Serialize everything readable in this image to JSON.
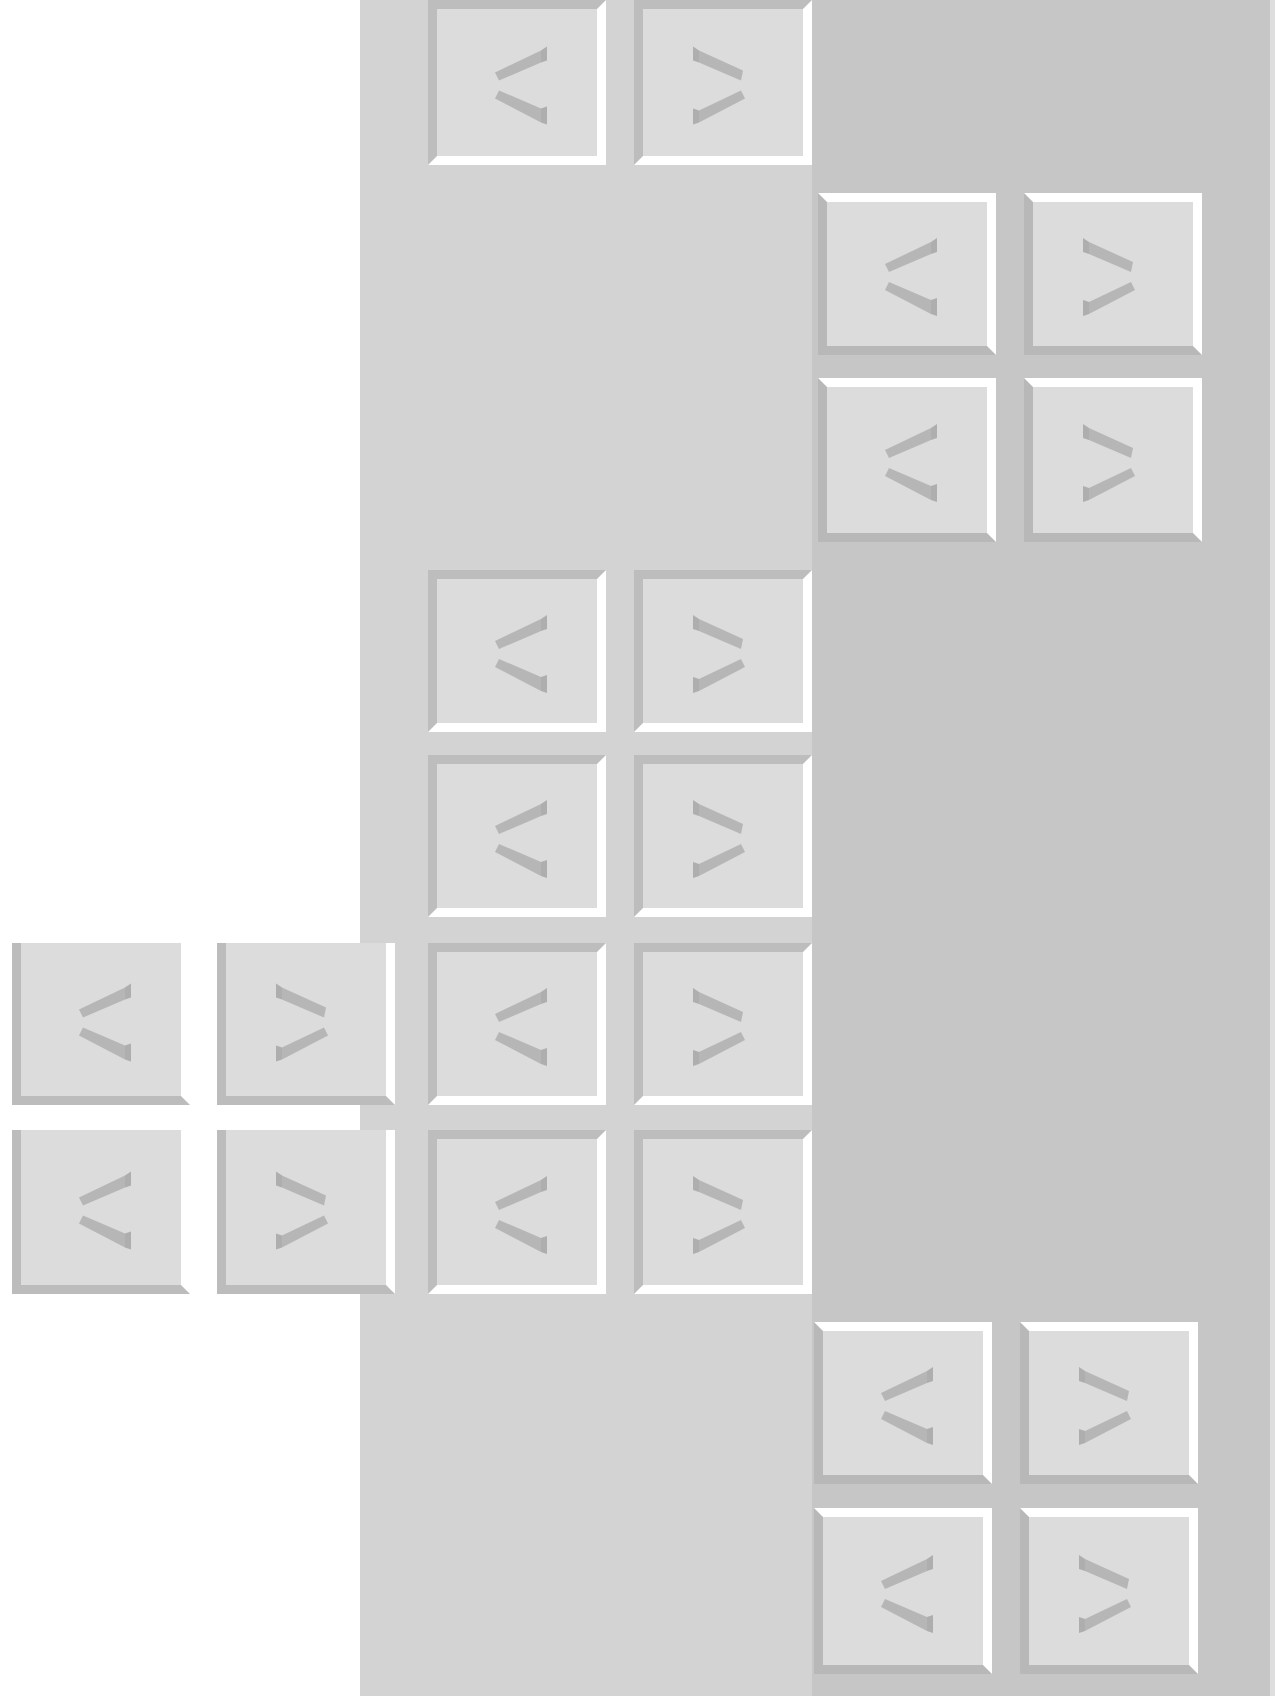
{
  "colors": {
    "page_bg": "#ffffff",
    "middle_region": "#d3d3d3",
    "right_region": "#c6c6c6",
    "button_face": "#dcdcdc",
    "bevel_dark": "#bcbcbc",
    "bevel_light": "#ffffff",
    "chevron": "#aaaaaa"
  },
  "button_groups": [
    {
      "name": "middle-group",
      "style": "inset",
      "buttons": [
        {
          "icon": "chevron-left-icon",
          "glyph": "<",
          "x": 428,
          "y": 0,
          "h": 165
        },
        {
          "icon": "chevron-right-icon",
          "glyph": ">",
          "x": 634,
          "y": 0,
          "h": 165
        },
        {
          "icon": "chevron-left-icon",
          "glyph": "<",
          "x": 428,
          "y": 570,
          "h": 162
        },
        {
          "icon": "chevron-right-icon",
          "glyph": ">",
          "x": 634,
          "y": 570,
          "h": 162
        },
        {
          "icon": "chevron-left-icon",
          "glyph": "<",
          "x": 428,
          "y": 755,
          "h": 162
        },
        {
          "icon": "chevron-right-icon",
          "glyph": ">",
          "x": 634,
          "y": 755,
          "h": 162
        },
        {
          "icon": "chevron-left-icon",
          "glyph": "<",
          "x": 428,
          "y": 943,
          "h": 162
        },
        {
          "icon": "chevron-right-icon",
          "glyph": ">",
          "x": 634,
          "y": 943,
          "h": 162
        },
        {
          "icon": "chevron-left-icon",
          "glyph": "<",
          "x": 428,
          "y": 1130,
          "h": 164
        },
        {
          "icon": "chevron-right-icon",
          "glyph": ">",
          "x": 634,
          "y": 1130,
          "h": 164
        }
      ]
    },
    {
      "name": "right-top-group",
      "style": "raised",
      "buttons": [
        {
          "icon": "chevron-left-icon",
          "glyph": "<",
          "x": 818,
          "y": 193,
          "h": 162
        },
        {
          "icon": "chevron-right-icon",
          "glyph": ">",
          "x": 1024,
          "y": 193,
          "h": 162
        },
        {
          "icon": "chevron-left-icon",
          "glyph": "<",
          "x": 818,
          "y": 378,
          "h": 164
        },
        {
          "icon": "chevron-right-icon",
          "glyph": ">",
          "x": 1024,
          "y": 378,
          "h": 164
        }
      ]
    },
    {
      "name": "right-bottom-group",
      "style": "raised",
      "buttons": [
        {
          "icon": "chevron-left-icon",
          "glyph": "<",
          "x": 814,
          "y": 1322,
          "h": 162
        },
        {
          "icon": "chevron-right-icon",
          "glyph": ">",
          "x": 1020,
          "y": 1322,
          "h": 162
        },
        {
          "icon": "chevron-left-icon",
          "glyph": "<",
          "x": 814,
          "y": 1508,
          "h": 166
        },
        {
          "icon": "chevron-right-icon",
          "glyph": ">",
          "x": 1020,
          "y": 1508,
          "h": 166
        }
      ]
    },
    {
      "name": "left-group",
      "style": "flat",
      "buttons": [
        {
          "icon": "chevron-left-icon",
          "glyph": "<",
          "x": 12,
          "y": 943,
          "h": 162
        },
        {
          "icon": "chevron-right-icon",
          "glyph": ">",
          "x": 217,
          "y": 943,
          "h": 162
        },
        {
          "icon": "chevron-left-icon",
          "glyph": "<",
          "x": 12,
          "y": 1130,
          "h": 164
        },
        {
          "icon": "chevron-right-icon",
          "glyph": ">",
          "x": 217,
          "y": 1130,
          "h": 164
        }
      ]
    }
  ]
}
